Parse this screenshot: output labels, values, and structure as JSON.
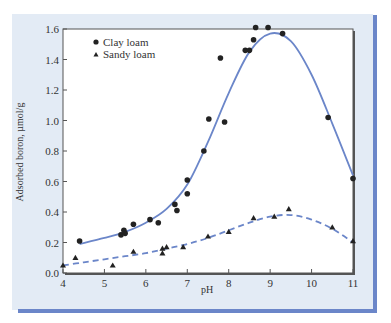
{
  "chart_data": {
    "type": "scatter",
    "title": "",
    "xlabel": "pH",
    "ylabel": "Adsorbed boron, µmol/g",
    "xlim": [
      4,
      11
    ],
    "ylim": [
      0.0,
      1.6
    ],
    "xticks": [
      "4",
      "5",
      "6",
      "7",
      "8",
      "9",
      "10",
      "11"
    ],
    "yticks": [
      "0.0",
      "0.2",
      "0.4",
      "0.6",
      "0.8",
      "1.0",
      "1.2",
      "1.4",
      "1.6"
    ],
    "grid": false,
    "legend_position": "upper-left",
    "series": [
      {
        "name": "Clay loam",
        "marker": "circle",
        "fit_line": "solid",
        "line_color": "#6b86c9",
        "points": [
          [
            4.4,
            0.21
          ],
          [
            5.4,
            0.25
          ],
          [
            5.47,
            0.28
          ],
          [
            5.5,
            0.26
          ],
          [
            5.7,
            0.32
          ],
          [
            6.1,
            0.35
          ],
          [
            6.3,
            0.33
          ],
          [
            6.7,
            0.45
          ],
          [
            6.75,
            0.41
          ],
          [
            7.0,
            0.61
          ],
          [
            7.0,
            0.52
          ],
          [
            7.4,
            0.8
          ],
          [
            7.52,
            1.01
          ],
          [
            7.8,
            1.41
          ],
          [
            7.9,
            0.99
          ],
          [
            8.4,
            1.46
          ],
          [
            8.5,
            1.46
          ],
          [
            8.6,
            1.53
          ],
          [
            8.65,
            1.61
          ],
          [
            8.95,
            1.61
          ],
          [
            9.3,
            1.57
          ],
          [
            10.4,
            1.02
          ],
          [
            11.0,
            0.62
          ]
        ],
        "fit": [
          [
            4.4,
            0.19
          ],
          [
            5.0,
            0.23
          ],
          [
            5.5,
            0.27
          ],
          [
            6.0,
            0.33
          ],
          [
            6.5,
            0.42
          ],
          [
            7.0,
            0.58
          ],
          [
            7.5,
            0.86
          ],
          [
            8.0,
            1.18
          ],
          [
            8.5,
            1.45
          ],
          [
            9.0,
            1.57
          ],
          [
            9.5,
            1.52
          ],
          [
            10.0,
            1.3
          ],
          [
            10.5,
            0.98
          ],
          [
            11.0,
            0.64
          ]
        ]
      },
      {
        "name": "Sandy loam",
        "marker": "triangle",
        "fit_line": "dashed",
        "line_color": "#6b86c9",
        "points": [
          [
            4.0,
            0.05
          ],
          [
            4.3,
            0.1
          ],
          [
            5.2,
            0.05
          ],
          [
            5.7,
            0.14
          ],
          [
            6.4,
            0.16
          ],
          [
            6.4,
            0.13
          ],
          [
            6.5,
            0.17
          ],
          [
            6.9,
            0.17
          ],
          [
            7.5,
            0.24
          ],
          [
            8.0,
            0.27
          ],
          [
            8.6,
            0.36
          ],
          [
            9.1,
            0.37
          ],
          [
            9.45,
            0.42
          ],
          [
            10.5,
            0.3
          ],
          [
            11.0,
            0.21
          ]
        ],
        "fit": [
          [
            4.0,
            0.05
          ],
          [
            4.5,
            0.07
          ],
          [
            5.0,
            0.09
          ],
          [
            5.5,
            0.11
          ],
          [
            6.0,
            0.13
          ],
          [
            6.5,
            0.16
          ],
          [
            7.0,
            0.19
          ],
          [
            7.5,
            0.23
          ],
          [
            8.0,
            0.28
          ],
          [
            8.5,
            0.33
          ],
          [
            9.0,
            0.37
          ],
          [
            9.5,
            0.38
          ],
          [
            10.0,
            0.35
          ],
          [
            10.5,
            0.29
          ],
          [
            11.0,
            0.2
          ]
        ]
      }
    ]
  },
  "legend": {
    "items": [
      {
        "label": "Clay loam"
      },
      {
        "label": "Sandy loam"
      }
    ]
  },
  "colors": {
    "panel_bg": "#e3ebf5",
    "accent_bar": "#6b86c9",
    "plot_bg": "#ffffff",
    "frame": "#333333",
    "marker": "#222222"
  }
}
